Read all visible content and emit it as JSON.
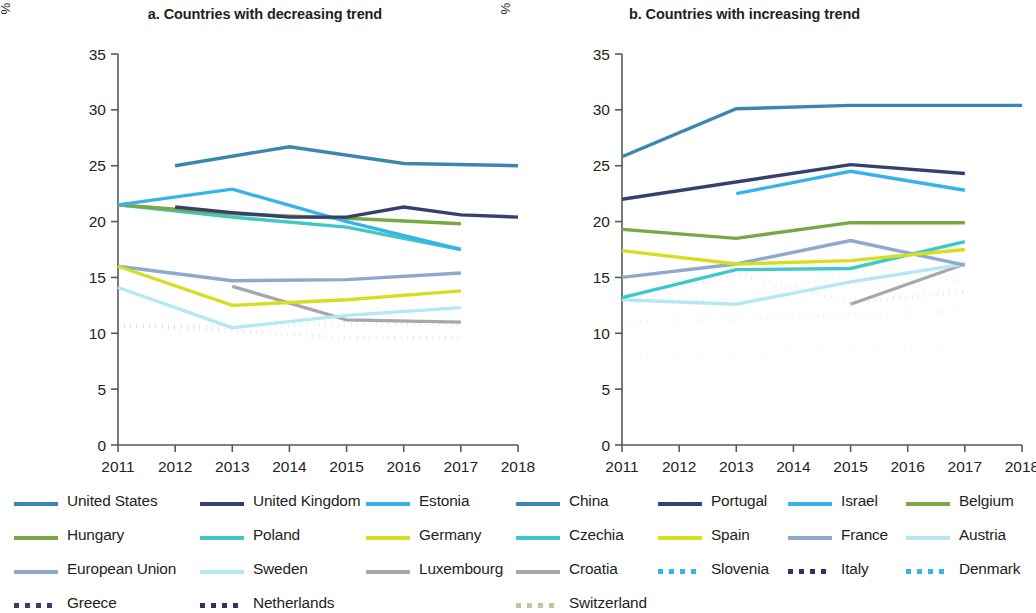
{
  "figure": {
    "y_axis_label": "% of older adults with any ADL/IADL limitations",
    "y_ticks": [
      "0",
      "5",
      "10",
      "15",
      "20",
      "25",
      "30",
      "35"
    ],
    "x_ticks": [
      "2011",
      "2012",
      "2013",
      "2014",
      "2015",
      "2016",
      "2017",
      "2018"
    ]
  },
  "panels": [
    {
      "id": "a",
      "title": "a. Countries with decreasing trend"
    },
    {
      "id": "b",
      "title": "b. Countries with increasing trend"
    }
  ],
  "chart_data": [
    {
      "type": "line",
      "title": "a. Countries with decreasing trend",
      "xlabel": "",
      "ylabel": "% of older adults with any ADL/IADL limitations",
      "x": [
        2011,
        2012,
        2013,
        2014,
        2015,
        2016,
        2017,
        2018
      ],
      "xlim": [
        2011,
        2018
      ],
      "ylim": [
        0,
        35
      ],
      "yticks": [
        0,
        5,
        10,
        15,
        20,
        25,
        30,
        35
      ],
      "grid": false,
      "legend_position": "below",
      "series": [
        {
          "name": "United States",
          "color": "#3b87b0",
          "style": "solid",
          "x": [
            2012,
            2014,
            2016,
            2018
          ],
          "values": [
            25.0,
            26.7,
            25.2,
            25.0
          ]
        },
        {
          "name": "United Kingdom",
          "color": "#36406e",
          "style": "solid",
          "x": [
            2012,
            2013,
            2014,
            2015,
            2016,
            2017,
            2018
          ],
          "values": [
            21.3,
            20.8,
            20.4,
            20.4,
            21.3,
            20.6,
            20.4
          ]
        },
        {
          "name": "Estonia",
          "color": "#37b3e8",
          "style": "solid",
          "x": [
            2011,
            2013,
            2015,
            2017
          ],
          "values": [
            21.5,
            22.9,
            20.0,
            17.5
          ]
        },
        {
          "name": "Hungary",
          "color": "#77a843",
          "style": "solid",
          "x": [
            2011,
            2013,
            2015,
            2017
          ],
          "values": [
            21.5,
            20.7,
            20.3,
            19.8
          ]
        },
        {
          "name": "Poland",
          "color": "#3ec8c8",
          "style": "solid",
          "x": [
            2011,
            2013,
            2015,
            2017
          ],
          "values": [
            21.5,
            20.4,
            19.5,
            17.5
          ]
        },
        {
          "name": "Germany",
          "color": "#d6de22",
          "style": "solid",
          "x": [
            2011,
            2013,
            2015,
            2017
          ],
          "values": [
            16.0,
            12.5,
            13.0,
            13.8
          ]
        },
        {
          "name": "European Union",
          "color": "#8fa9cc",
          "style": "solid",
          "x": [
            2011,
            2013,
            2015,
            2017
          ],
          "values": [
            16.0,
            14.7,
            14.8,
            15.4
          ]
        },
        {
          "name": "Sweden",
          "color": "#b4e8f2",
          "style": "solid",
          "x": [
            2011,
            2013,
            2015,
            2017
          ],
          "values": [
            14.1,
            10.5,
            11.6,
            12.3
          ]
        },
        {
          "name": "Luxembourg",
          "color": "#a6a8ab",
          "style": "solid",
          "x": [
            2013,
            2015,
            2017
          ],
          "values": [
            14.2,
            11.2,
            11.0
          ]
        },
        {
          "name": "Greece",
          "color": "#36406e",
          "style": "dotted",
          "x": [
            2011,
            2013,
            2015,
            2017
          ],
          "values": [
            10.7,
            10.6,
            10.8,
            10.8
          ]
        },
        {
          "name": "Netherlands",
          "color": "#2a3566",
          "style": "dotted",
          "x": [
            2011,
            2013,
            2015,
            2017
          ],
          "values": [
            10.7,
            10.2,
            9.6,
            9.6
          ]
        }
      ]
    },
    {
      "type": "line",
      "title": "b. Countries with increasing trend",
      "xlabel": "",
      "ylabel": "% of older adults with any ADL/IADL limitations",
      "x": [
        2011,
        2018
      ],
      "xlim": [
        2011,
        2018
      ],
      "ylim": [
        0,
        35
      ],
      "yticks": [
        0,
        5,
        10,
        15,
        20,
        25,
        30,
        35
      ],
      "grid": false,
      "legend_position": "below",
      "series": [
        {
          "name": "China",
          "color": "#3b87b0",
          "style": "solid",
          "x": [
            2011,
            2013,
            2015,
            2018
          ],
          "values": [
            25.8,
            30.1,
            30.4,
            30.4
          ]
        },
        {
          "name": "Portugal",
          "color": "#36406e",
          "style": "solid",
          "x": [
            2011,
            2015,
            2017
          ],
          "values": [
            22.0,
            25.1,
            24.3
          ]
        },
        {
          "name": "Israel",
          "color": "#37b3e8",
          "style": "solid",
          "x": [
            2013,
            2015,
            2017
          ],
          "values": [
            22.5,
            24.5,
            22.8
          ]
        },
        {
          "name": "Belgium",
          "color": "#77a843",
          "style": "solid",
          "x": [
            2011,
            2013,
            2015,
            2017
          ],
          "values": [
            19.3,
            18.5,
            19.9,
            19.9
          ]
        },
        {
          "name": "Spain",
          "color": "#d6de22",
          "style": "solid",
          "x": [
            2011,
            2013,
            2015,
            2017
          ],
          "values": [
            17.4,
            16.2,
            16.5,
            17.5
          ]
        },
        {
          "name": "France",
          "color": "#8fa9cc",
          "style": "solid",
          "x": [
            2011,
            2013,
            2015,
            2017
          ],
          "values": [
            15.0,
            16.2,
            18.3,
            16.1
          ]
        },
        {
          "name": "Czechia",
          "color": "#3ec8c8",
          "style": "solid",
          "x": [
            2011,
            2013,
            2015,
            2017
          ],
          "values": [
            13.2,
            15.7,
            15.8,
            18.2
          ]
        },
        {
          "name": "Austria",
          "color": "#b4e8f2",
          "style": "solid",
          "x": [
            2011,
            2013,
            2015,
            2017
          ],
          "values": [
            13.0,
            12.6,
            14.6,
            16.2
          ]
        },
        {
          "name": "Croatia",
          "color": "#a6a8ab",
          "style": "solid",
          "x": [
            2015,
            2017
          ],
          "values": [
            12.6,
            16.2
          ]
        },
        {
          "name": "Slovenia",
          "color": "#37b3e8",
          "style": "dotted",
          "x": [
            2011,
            2013,
            2015,
            2017
          ],
          "values": [
            13.2,
            13.0,
            15.4,
            14.7
          ]
        },
        {
          "name": "Italy",
          "color": "#2a3566",
          "style": "dotted",
          "x": [
            2011,
            2013,
            2015,
            2017
          ],
          "values": [
            13.2,
            15.3,
            12.8,
            13.7
          ]
        },
        {
          "name": "Denmark",
          "color": "#37b3e8",
          "style": "dotted",
          "x": [
            2011,
            2013,
            2015,
            2017
          ],
          "values": [
            11.1,
            11.2,
            11.7,
            12.0
          ]
        },
        {
          "name": "Switzerland",
          "color": "#b4cc9e",
          "style": "dotted",
          "x": [
            2011,
            2013,
            2015,
            2017
          ],
          "values": [
            8.0,
            7.9,
            9.0,
            8.6
          ]
        }
      ]
    }
  ],
  "legends": {
    "left": [
      [
        {
          "label": "United States",
          "color": "#3b87b0",
          "style": "solid"
        },
        {
          "label": "United Kingdom",
          "color": "#36406e",
          "style": "solid"
        },
        {
          "label": "Estonia",
          "color": "#37b3e8",
          "style": "solid"
        }
      ],
      [
        {
          "label": "Hungary",
          "color": "#77a843",
          "style": "solid"
        },
        {
          "label": "Poland",
          "color": "#3ec8c8",
          "style": "solid"
        },
        {
          "label": "Germany",
          "color": "#d6de22",
          "style": "solid"
        }
      ],
      [
        {
          "label": "European Union",
          "color": "#8fa9cc",
          "style": "solid"
        },
        {
          "label": "Sweden",
          "color": "#b4e8f2",
          "style": "solid"
        },
        {
          "label": "Luxembourg",
          "color": "#a6a8ab",
          "style": "solid"
        }
      ],
      [
        {
          "label": "Greece",
          "color": "#36406e",
          "style": "dotted"
        },
        {
          "label": "Netherlands",
          "color": "#2a3566",
          "style": "dotted"
        }
      ]
    ],
    "right": [
      [
        {
          "label": "China",
          "color": "#3b87b0",
          "style": "solid"
        },
        {
          "label": "Portugal",
          "color": "#36406e",
          "style": "solid"
        },
        {
          "label": "Israel",
          "color": "#37b3e8",
          "style": "solid"
        },
        {
          "label": "Belgium",
          "color": "#77a843",
          "style": "solid"
        }
      ],
      [
        {
          "label": "Czechia",
          "color": "#3ec8c8",
          "style": "solid"
        },
        {
          "label": "Spain",
          "color": "#d6de22",
          "style": "solid"
        },
        {
          "label": "France",
          "color": "#8fa9cc",
          "style": "solid"
        },
        {
          "label": "Austria",
          "color": "#b4e8f2",
          "style": "solid"
        }
      ],
      [
        {
          "label": "Croatia",
          "color": "#a6a8ab",
          "style": "solid"
        },
        {
          "label": "Slovenia",
          "color": "#37b3e8",
          "style": "dotted"
        },
        {
          "label": "Italy",
          "color": "#2a3566",
          "style": "dotted"
        },
        {
          "label": "Denmark",
          "color": "#37b3e8",
          "style": "dotted"
        }
      ],
      [
        {
          "label": "Switzerland",
          "color": "#b4cc9e",
          "style": "dotted"
        }
      ]
    ]
  }
}
